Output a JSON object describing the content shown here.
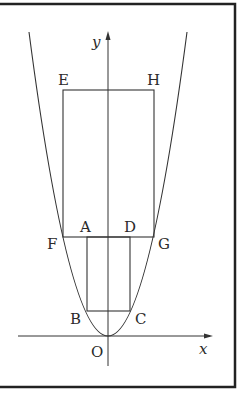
{
  "figure": {
    "type": "geometry-diagram",
    "axes": {
      "x_label": "x",
      "y_label": "y",
      "origin_label": "O"
    },
    "points": {
      "A": "A",
      "B": "B",
      "C": "C",
      "D": "D",
      "E": "E",
      "F": "F",
      "G": "G",
      "H": "H"
    },
    "colors": {
      "line": "#333333",
      "frame": "#222222",
      "background": "#ffffff"
    }
  }
}
